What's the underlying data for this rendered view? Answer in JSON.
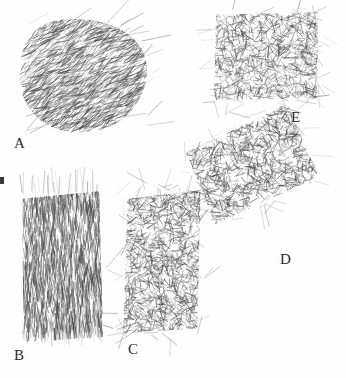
{
  "figure": {
    "kind": "pencil-shading-specimen-plate",
    "background_color": "#fefefe",
    "ink_color": "#4a4a4a",
    "label_color": "#2b2b2b",
    "width": 346,
    "height": 378,
    "panel_count": 5
  },
  "edge_mark": {
    "name": "left-edge-tick",
    "x": 0,
    "y": 177,
    "width": 4,
    "height": 7,
    "color": "#3a3a3a"
  },
  "panels": [
    {
      "id": "A",
      "label": "A",
      "shape": "rounded-blob",
      "stroke_direction": "diagonal-sweeping",
      "tone": "dark",
      "x": 18,
      "y": 18,
      "width": 130,
      "height": 115,
      "rotation": 0,
      "label_x": 14,
      "label_y": 136,
      "density": 0.82,
      "seed": 11
    },
    {
      "id": "B",
      "label": "B",
      "shape": "rectangle-tall",
      "stroke_direction": "vertical",
      "tone": "dark",
      "x": 22,
      "y": 192,
      "width": 80,
      "height": 150,
      "rotation": -1,
      "label_x": 14,
      "label_y": 348,
      "density": 0.86,
      "seed": 23
    },
    {
      "id": "C",
      "label": "C",
      "shape": "rectangle-tall",
      "stroke_direction": "mixed-scribble",
      "tone": "medium-dark",
      "x": 120,
      "y": 188,
      "width": 82,
      "height": 148,
      "rotation": 4,
      "label_x": 128,
      "label_y": 342,
      "density": 0.78,
      "seed": 37
    },
    {
      "id": "D",
      "label": "D",
      "shape": "rectangle-rotated",
      "stroke_direction": "mixed-scribble",
      "tone": "medium",
      "x": 194,
      "y": 124,
      "width": 116,
      "height": 80,
      "rotation": -24,
      "label_x": 280,
      "label_y": 252,
      "density": 0.7,
      "seed": 53
    },
    {
      "id": "E",
      "label": "E",
      "shape": "rectangle-wide",
      "stroke_direction": "mixed-scribble",
      "tone": "medium",
      "x": 214,
      "y": 12,
      "width": 105,
      "height": 88,
      "rotation": 0,
      "label_x": 291,
      "label_y": 110,
      "density": 0.72,
      "seed": 71
    }
  ]
}
